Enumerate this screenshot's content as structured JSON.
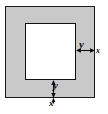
{
  "figure": {
    "name": "square-with-square-hole-diagram",
    "colors": {
      "plate_fill": "#c9c9c9",
      "hole_fill": "#ffffff",
      "outline": "#1c1c1c",
      "annotation": "#0d0d0d",
      "background": "#ffffff"
    },
    "shapes": {
      "outer_square": {
        "label": "outer-square"
      },
      "inner_square": {
        "label": "inner-square"
      }
    },
    "labels": {
      "right_band_y": "y",
      "right_edge_x": "x",
      "bottom_band_y": "y",
      "bottom_edge_x": "x"
    },
    "annotations": {
      "right_arrow": "horizontal-double-arrow",
      "bottom_arrow": "vertical-double-arrow",
      "bottom_tick": "tick-mark"
    }
  }
}
